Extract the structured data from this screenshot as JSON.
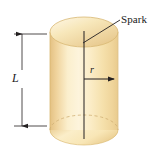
{
  "figure": {
    "kind": "physics-diagram-cylinder",
    "canvas": {
      "width": 162,
      "height": 154,
      "background": "#ffffff"
    },
    "colors": {
      "cylinder_light": "#fdf0cf",
      "cylinder_mid": "#f6dfa8",
      "cylinder_dark": "#e8c887",
      "cylinder_edge": "#d9b770",
      "top_face_light": "#fdf3dc",
      "top_face_dark": "#eccf92",
      "line": "#231f20",
      "dashed_line": "#c9a86a"
    },
    "labels": {
      "spark": "Spark",
      "length": "L",
      "radius": "r"
    },
    "annotations": {
      "spark_leader": {
        "from_x": 83,
        "from_y": 43,
        "to_x": 120,
        "to_y": 20
      },
      "length_dimension": {
        "x": 22,
        "top_y": 34,
        "bottom_y": 126
      },
      "radius_arrow": {
        "from_x": 84,
        "from_y": 79,
        "to_x": 116,
        "to_y": 79
      },
      "axis_line": {
        "x": 84,
        "top_y": 31,
        "bottom_y": 139
      }
    },
    "geometry": {
      "cylinder_left": 50,
      "cylinder_right": 118,
      "top_ellipse_cy": 32,
      "top_ellipse_ry": 15,
      "bottom_ellipse_cy": 130,
      "bottom_ellipse_ry": 15
    }
  }
}
